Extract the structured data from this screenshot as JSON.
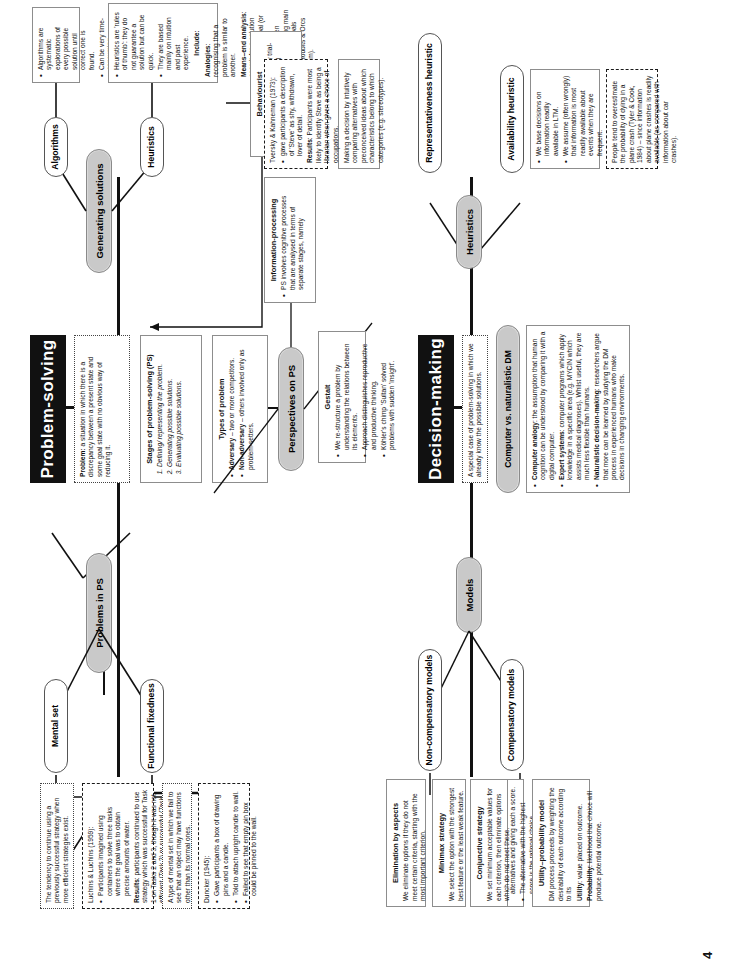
{
  "page": {
    "number": "4"
  },
  "sections": {
    "ps": {
      "title": "Problem-solving",
      "definition": {
        "text_lead": "Problem:",
        "text": " a situation in which there is a discrepancy between a present state and some goal state with no obvious way of reducing it."
      },
      "stages": {
        "heading": "Stages of problem-solving (PS)",
        "items": [
          "Defining/ representing the problem.",
          "Generating possible solutions.",
          "Evaluating possible solutions."
        ]
      },
      "types": {
        "heading": "Types of problem",
        "items": [
          {
            "term": "Adversary",
            "text": " – two or more competitors."
          },
          {
            "term": "Non-adversary",
            "text": " – others involved only as problem-setters."
          }
        ]
      },
      "branches": {
        "problems": {
          "label": "Problems in PS",
          "children": [
            {
              "label": "Mental set",
              "body": "The tendency to continue using a previously successful strategy when more efficient strategies exist.",
              "study": {
                "citation": "Luchins & Luchins (1959):",
                "bullets": [
                  "Participants imagined using containers to solve three tasks where the goal was to obtain precise amounts of water."
                ],
                "results_term": "Results",
                "results": ": participants continued to use strategy which was successful for Task 1 on Tasks 2 and 3, though it was not efficient (Task 2) or successful (Task 3)."
              }
            },
            {
              "label": "Functional fixedness",
              "body": "A type of mental set in which we fail to see that an object may have functions other than its normal ones.",
              "study": {
                "citation": "Duncker (1945):",
                "bullets": [
                  "Gave participants a box of drawing pins and a candle.",
                  "Told to attach upright candle to wall.",
                  "Failed to see that empty pin box could be pinned to the wall."
                ]
              }
            }
          ]
        },
        "generating": {
          "label": "Generating solutions",
          "children": [
            {
              "label": "Algorithms",
              "bullets": [
                "Algorithms are systematic explorations of every possible solution until correct one is found.",
                "Can be very time-consuming."
              ]
            },
            {
              "label": "Heuristics",
              "bullets": [
                "Heuristics are 'rules of thumb': they do not guarantee a solution but can be quick.",
                "They are based mainly on intuition and past experience."
              ],
              "include_heading": "Include:",
              "include": [
                {
                  "term": "Analogies",
                  "text": ": recognising that a problem is similar to another."
                },
                {
                  "term": "Means–end analysis",
                  "text": ": search for a solution begins at the goal (or end) and works backwards. Often involves breaking main goal into sub-goals (e.g. Hobbits & Orcs problem)."
                }
              ]
            }
          ]
        },
        "perspectives": {
          "label": "Perspectives on PS",
          "children": [
            {
              "label": "Information-processing",
              "bullets": [
                "PS involves cognitive processes that are analysed in terms of separate stages, namely"
              ]
            },
            {
              "label": "Behaviourist",
              "bullets": [
                "Problem-solving is essentially trial-and-error involving accidental success.",
                "Successful behaviours are reinforced and PS improves."
              ]
            },
            {
              "label": "Gestalt",
              "bullets": [
                "We re-structure a problem by understanding the relations between its elements.",
                "Approach distinguishes reproductive and productive thinking.",
                "Köhler's chimp 'Sultan' solved problems with sudden 'insight'."
              ]
            }
          ]
        }
      }
    },
    "dm": {
      "title": "Decision-making",
      "definition": {
        "text": "A special case of problem-solving in which we already know the possible solutions."
      },
      "branches": {
        "models": {
          "label": "Models",
          "children": [
            {
              "label": "Compensatory models",
              "sub": [
                {
                  "heading": "Additive compensatory model",
                  "bullets": [
                    "We start the DM process by evaluating the features of alternatives and giving each a score.",
                    "The alternative with the highest score is the rational choice."
                  ]
                },
                {
                  "heading": "Utility–probability model",
                  "body": "DM process proceeds by weighting the desirability of each outcome according to its",
                  "terms": [
                    {
                      "term": "Utility",
                      "text": ": value placed on outcome."
                    },
                    {
                      "term": "Probability",
                      "text": ": likelihood that choice will produce potential outcome."
                    }
                  ]
                }
              ]
            },
            {
              "label": "Non-compensatory models",
              "sub": [
                {
                  "heading": "Elimination by aspects",
                  "body": "We eliminate options if they do not meet certain criteria, starting with the most important criterion."
                },
                {
                  "heading": "Minimax strategy",
                  "body": "We select the option with the strongest best feature or the least weak feature."
                },
                {
                  "heading": "Conjunctive strategy",
                  "body": "We set minimum acceptable values for each criterion, then eliminate options which do not meet these."
                }
              ]
            }
          ]
        },
        "computer": {
          "label": "Computer vs. naturalistic DM",
          "items": [
            {
              "term": "Computer analogy",
              "text": ": the assumption that human cognition can be understood by comparing it with a digital computer."
            },
            {
              "term": "Expert systems",
              "text": ": computer programs which apply knowledge in a specific area (e.g. MYCIN which assists medical diagnoses). Whilst useful, they are much less flexible than humans."
            },
            {
              "term": "Naturalistic decision-making",
              "text": ": researchers argue that more can be learned by studying the DM process in experienced humans who make decisions in changing environments."
            }
          ]
        },
        "heuristics": {
          "label": "Heuristics",
          "children": [
            {
              "label": "Availability heuristic",
              "bullets": [
                "We base decisions on information readily available in LTM.",
                "We assume (often wrongly) that information is most readily available about events when they are frequent.",
                "Therefore, if we can easily think of information about an event, it is more likely to happen."
              ],
              "study": {
                "text": "People tend to overestimate the probability of dying in a plane crash (Tyler & Cook, 1984) – since information about plane crashes is readily available (as compared with information about car crashes)."
              }
            },
            {
              "label": "Representativeness heuristic",
              "body": "Making a decision by intuitively comparing alternatives with preconceived ideas about which characteristics belong to which categories (e.g. stereotypes).",
              "study": {
                "citation": "Tversky & Kahneman (1973):",
                "bullets": [
                  "gave participants a description of 'Steve' as shy, withdrawn, lover of detail."
                ],
                "results_term": "Results",
                "results": ": Participants were most likely to identify Steve as being a librarian when given a choice of occupations."
              }
            }
          ]
        }
      }
    }
  }
}
